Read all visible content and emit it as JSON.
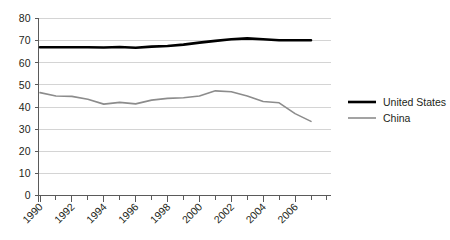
{
  "chart_data": {
    "type": "line",
    "title": "",
    "subtitle": "",
    "xlabel": "",
    "ylabel": "",
    "xlim": [
      1990,
      2007
    ],
    "ylim": [
      0,
      80
    ],
    "yticks": [
      0,
      10,
      20,
      30,
      40,
      50,
      60,
      70,
      80
    ],
    "ytick_labels": [
      "0",
      "10",
      "20",
      "30",
      "40",
      "50",
      "60",
      "70",
      "80"
    ],
    "xticks": [
      1990,
      1992,
      1994,
      1996,
      1998,
      2000,
      2002,
      2004,
      2006
    ],
    "xtick_labels": [
      "1990",
      "1992",
      "1994",
      "1996",
      "1998",
      "2000",
      "2002",
      "2004",
      "2006"
    ],
    "x": [
      1990,
      1991,
      1992,
      1993,
      1994,
      1995,
      1996,
      1997,
      1998,
      1999,
      2000,
      2001,
      2002,
      2003,
      2004,
      2005,
      2006,
      2007
    ],
    "grid": true,
    "grid_axis": "y",
    "legend_position": "right",
    "series": [
      {
        "name": "United States",
        "color": "#000000",
        "width": 2.6,
        "values": [
          67.0,
          67.0,
          67.0,
          67.0,
          66.9,
          67.1,
          66.8,
          67.3,
          67.6,
          68.2,
          69.1,
          69.9,
          70.6,
          71.0,
          70.6,
          70.2,
          70.2,
          70.2
        ]
      },
      {
        "name": "China",
        "color": "#8c8c8c",
        "width": 1.6,
        "values": [
          46.5,
          45.0,
          44.8,
          43.5,
          41.3,
          42.1,
          41.4,
          43.1,
          43.9,
          44.2,
          45.0,
          47.3,
          46.9,
          45.0,
          42.5,
          41.9,
          37.0,
          33.5
        ]
      }
    ],
    "legend": [
      {
        "label": "United States",
        "color": "#000000",
        "width": 2.6
      },
      {
        "label": "China",
        "color": "#8c8c8c",
        "width": 1.6
      }
    ]
  }
}
